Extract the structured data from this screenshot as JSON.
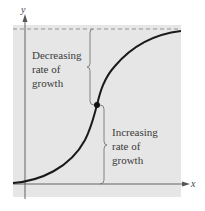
{
  "axes": {
    "x_label": "x",
    "y_label": "y"
  },
  "annotations": {
    "upper": [
      "Decreasing",
      "rate of",
      "growth"
    ],
    "lower": [
      "Increasing",
      "rate of",
      "growth"
    ]
  },
  "colors": {
    "panel": "#e6e6e6",
    "curve": "#1a1a1a",
    "axis": "#555555",
    "asymptote": "#8a8a8a",
    "brace": "#777777"
  },
  "features": {
    "horizontal_asymptote": "dashed line at top",
    "inflection_point": "marked with dot"
  }
}
